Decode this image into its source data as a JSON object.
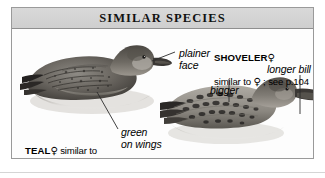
{
  "figure": {
    "title": "SIMILAR SPECIES",
    "border_color": "#9a9a9a",
    "header_color": "#d4d4d4",
    "plate_background": "#fdfdfd"
  },
  "annotations": [
    {
      "name": "plainer-face",
      "text": "plainer\nface",
      "style": "italic",
      "points_to": "teal-head"
    },
    {
      "name": "green-on-wings",
      "text": "green\non wings",
      "style": "italic",
      "points_to": "teal-wing"
    },
    {
      "name": "bigger",
      "text": "bigger",
      "style": "italic",
      "points_to": "shoveler-back"
    },
    {
      "name": "longer-bill",
      "text": "longer bill",
      "style": "italic",
      "points_to": "shoveler-bill"
    }
  ],
  "captions": [
    {
      "name": "teal-caption",
      "lead": "TEAL",
      "symbol": "♀",
      "body": " similar to adult autumn; see p.106",
      "page_reference": "p.106",
      "species": "TEAL",
      "sex": "female"
    },
    {
      "name": "shoveler-caption",
      "lead": "SHOVELER",
      "symbol": "♀",
      "body_line1": "",
      "body_line2_prefix": "similar to ",
      "body_line2_symbol": "♀",
      "body_line2_suffix": " ; see p.104",
      "page_reference": "p.104",
      "species": "SHOVELER",
      "sex": "female"
    }
  ],
  "illustrations": [
    {
      "name": "teal-female-duck",
      "description": "grayscale painting of a female Teal swimming with reflection",
      "species": "Teal"
    },
    {
      "name": "shoveler-female-duck",
      "description": "grayscale painting of a female Shoveler swimming with long bill extending past frame",
      "species": "Shoveler"
    }
  ]
}
